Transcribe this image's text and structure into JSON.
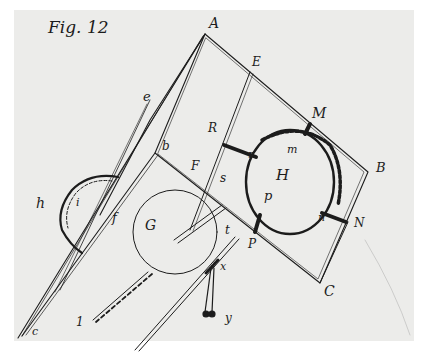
{
  "figure": {
    "title": "Fig. 12",
    "ink_color": "#1c1c1c",
    "paper_color": "#ececea",
    "border_color": "#ffffff"
  },
  "labels": {
    "A": "A",
    "E": "E",
    "M": "M",
    "B": "B",
    "N": "N",
    "C": "C",
    "R": "R",
    "F": "F",
    "P": "P",
    "H": "H",
    "G": "G",
    "b": "b",
    "e": "e",
    "c": "c",
    "h": "h",
    "i": "i",
    "f": "f",
    "r": "r",
    "m": "m",
    "p": "p",
    "n": "n",
    "s": "s",
    "t": "t",
    "x": "x",
    "y": "y",
    "one": "1"
  }
}
